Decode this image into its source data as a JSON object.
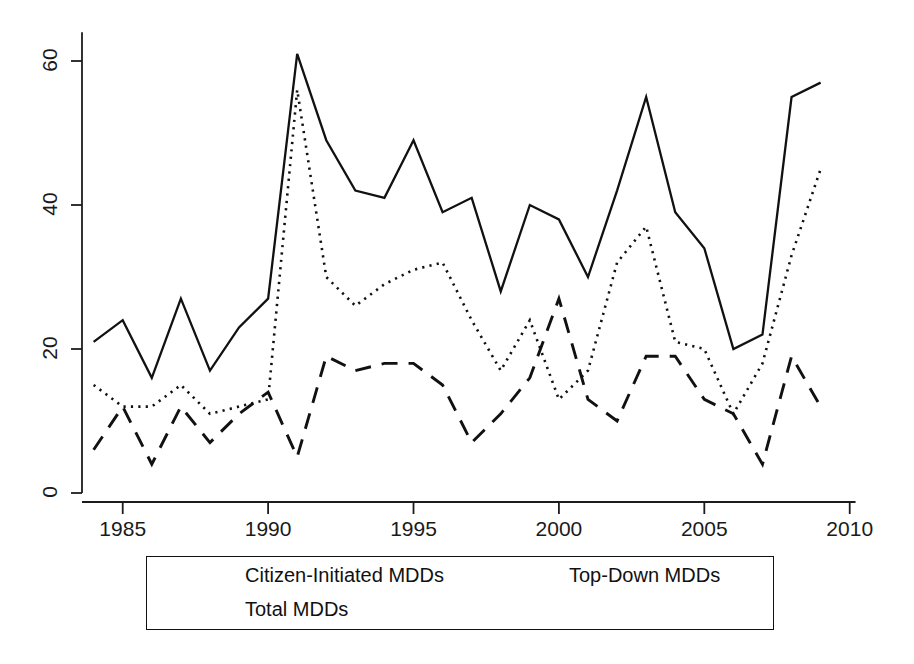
{
  "chart_data": {
    "type": "line",
    "title": "",
    "subtitle": "",
    "xlabel": "",
    "ylabel": "",
    "xlim": [
      1983.6,
      2010.2
    ],
    "ylim": [
      0,
      64
    ],
    "xticks": [
      1985,
      1990,
      1995,
      2000,
      2005,
      2010
    ],
    "yticks": [
      0,
      20,
      40,
      60
    ],
    "grid": false,
    "legend_position": "bottom",
    "x": [
      1984,
      1985,
      1986,
      1987,
      1988,
      1989,
      1990,
      1991,
      1992,
      1993,
      1994,
      1995,
      1996,
      1997,
      1998,
      1999,
      2000,
      2001,
      2002,
      2003,
      2004,
      2005,
      2006,
      2007,
      2008,
      2009
    ],
    "series": [
      {
        "name": "Citizen-Initiated MDDs",
        "style": "dashed",
        "color": "#111111",
        "values": [
          6,
          12,
          4,
          12,
          7,
          11,
          14,
          5,
          19,
          17,
          18,
          18,
          15,
          7,
          11,
          16,
          27,
          13,
          10,
          19,
          19,
          13,
          11,
          4,
          19,
          12
        ]
      },
      {
        "name": "Top-Down MDDs",
        "style": "dotted",
        "color": "#111111",
        "values": [
          15,
          12,
          12,
          15,
          11,
          12,
          13,
          56,
          30,
          26,
          29,
          31,
          32,
          24,
          17,
          24,
          13,
          17,
          32,
          37,
          21,
          20,
          11,
          18,
          33,
          45
        ]
      },
      {
        "name": "Total MDDs",
        "style": "solid",
        "color": "#111111",
        "values": [
          21,
          24,
          16,
          27,
          17,
          23,
          27,
          61,
          49,
          42,
          41,
          49,
          39,
          41,
          28,
          40,
          38,
          30,
          42,
          55,
          39,
          34,
          20,
          22,
          55,
          57
        ]
      }
    ]
  },
  "axis": {
    "y_tick_labels": [
      "0",
      "20",
      "40",
      "60"
    ],
    "x_tick_labels": [
      "1985",
      "1990",
      "1995",
      "2000",
      "2005",
      "2010"
    ]
  },
  "legend": {
    "entries": [
      {
        "label": "Citizen-Initiated MDDs",
        "style": "dashed"
      },
      {
        "label": "Top-Down MDDs",
        "style": "dotted"
      },
      {
        "label": "Total MDDs",
        "style": "solid"
      }
    ]
  }
}
